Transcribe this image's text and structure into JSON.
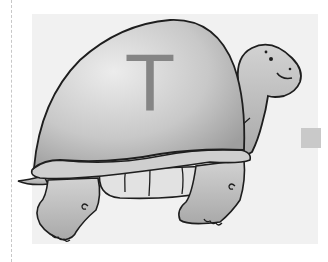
{
  "image": {
    "description": "Cartoon illustration of a smiling tortoise with a large gray shell bearing the letter T",
    "letter": "T",
    "colors": {
      "background": "#ffffff",
      "panel": "#f1f1f1",
      "shell_light": "#e0e0e0",
      "shell_dark": "#a8a8a8",
      "body": "#bdbdbd",
      "outline": "#1e1e1e",
      "letter": "#858585",
      "square": "#c9c9c9"
    }
  }
}
